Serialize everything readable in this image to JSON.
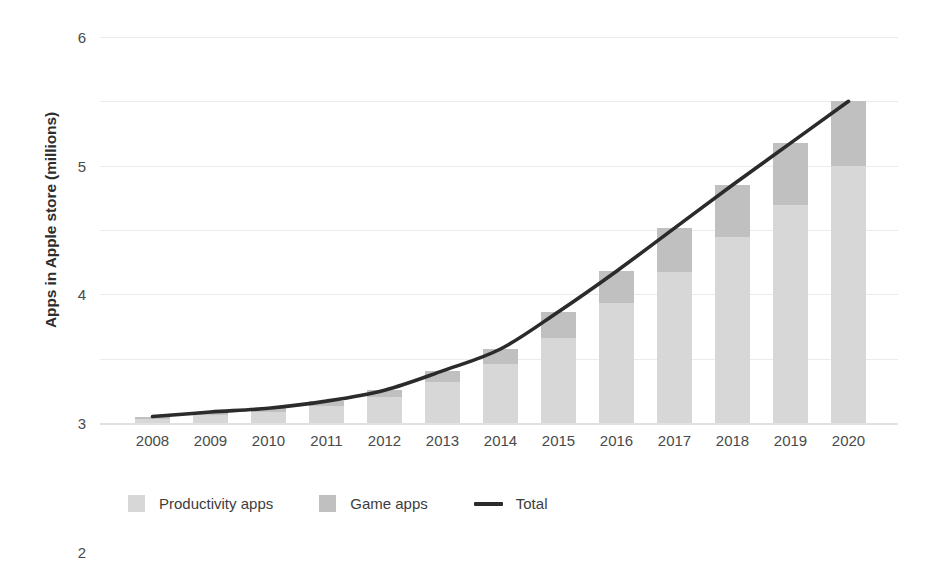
{
  "chart_data": {
    "type": "bar",
    "subtype": "stacked-bar-with-line-overlay",
    "title": "",
    "xlabel": "",
    "ylabel": "Apps in Apple store (millions)",
    "categories": [
      "2008",
      "2009",
      "2010",
      "2011",
      "2012",
      "2013",
      "2014",
      "2015",
      "2016",
      "2017",
      "2018",
      "2019",
      "2020"
    ],
    "series": [
      {
        "name": "Productivity apps",
        "type": "bar",
        "color": "#d7d7d7",
        "values": [
          0.06,
          0.12,
          0.17,
          0.26,
          0.4,
          0.64,
          0.92,
          1.32,
          1.87,
          2.35,
          2.89,
          3.39,
          4.0
        ]
      },
      {
        "name": "Game apps",
        "type": "bar",
        "color": "#c0c0c0",
        "values": [
          0.04,
          0.05,
          0.06,
          0.08,
          0.11,
          0.17,
          0.23,
          0.41,
          0.49,
          0.68,
          0.81,
          0.96,
          1.0
        ]
      },
      {
        "name": "Total",
        "type": "line",
        "color": "#2b2b2b",
        "values": [
          0.1,
          0.17,
          0.23,
          0.34,
          0.51,
          0.81,
          1.15,
          1.73,
          2.36,
          3.03,
          3.7,
          4.35,
          5.0
        ]
      }
    ],
    "ylim": [
      0,
      6
    ],
    "yticks": [
      0,
      1,
      2,
      3,
      4,
      5,
      6
    ],
    "ytick_labels": [
      "0",
      "1",
      "2",
      "3",
      "4",
      "5",
      "6"
    ],
    "grid": "horizontal",
    "legend_position": "bottom-left",
    "legend": [
      {
        "label": "Productivity apps",
        "marker": "square",
        "color": "#d7d7d7"
      },
      {
        "label": "Game apps",
        "marker": "square",
        "color": "#c0c0c0"
      },
      {
        "label": "Total",
        "marker": "line",
        "color": "#2b2b2b"
      }
    ]
  }
}
